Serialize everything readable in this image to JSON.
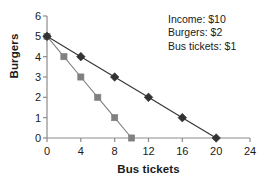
{
  "chart_data": {
    "type": "line",
    "title": "",
    "xlabel": "Bus tickets",
    "ylabel": "Burgers",
    "xlim": [
      0,
      24
    ],
    "ylim": [
      0,
      6
    ],
    "xticks": [
      0,
      4,
      8,
      12,
      16,
      20,
      24
    ],
    "yticks": [
      0,
      1,
      2,
      3,
      4,
      5,
      6
    ],
    "grid": false,
    "legend_position": "none",
    "series": [
      {
        "name": "budget-line-gray",
        "marker": "square",
        "color": "#808080",
        "points": [
          {
            "x": 0,
            "y": 5
          },
          {
            "x": 2,
            "y": 4
          },
          {
            "x": 4,
            "y": 3
          },
          {
            "x": 6,
            "y": 2
          },
          {
            "x": 8,
            "y": 1
          },
          {
            "x": 10,
            "y": 0
          }
        ]
      },
      {
        "name": "budget-line-black",
        "marker": "diamond",
        "color": "#333333",
        "points": [
          {
            "x": 0,
            "y": 5
          },
          {
            "x": 4,
            "y": 4
          },
          {
            "x": 8,
            "y": 3
          },
          {
            "x": 12,
            "y": 2
          },
          {
            "x": 16,
            "y": 1
          },
          {
            "x": 20,
            "y": 0
          }
        ]
      }
    ],
    "annotations": [
      "Income: $10",
      "Burgers: $2",
      "Bus tickets: $1"
    ]
  },
  "axis_color": "#8c8c8c",
  "text_color": "#1a1a1a"
}
